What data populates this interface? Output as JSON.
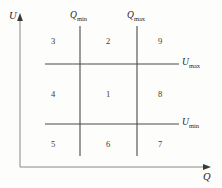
{
  "figure": {
    "background_color": "#fdfdfc",
    "line_color": "#4a4a4a",
    "axis_color": "#8a8a8a",
    "text_color": "#2a2a2a",
    "axes": {
      "y_axis_label": "U",
      "x_axis_label": "Q"
    },
    "vertical_dividers": [
      {
        "name": "Q-min",
        "label_base": "Q",
        "label_sub": "min",
        "x": 80
      },
      {
        "name": "Q-max",
        "label_base": "Q",
        "label_sub": "max",
        "x": 137
      }
    ],
    "horizontal_dividers": [
      {
        "name": "U-max",
        "label_base": "U",
        "label_sub": "max",
        "y": 64
      },
      {
        "name": "U-min",
        "label_base": "U",
        "label_sub": "min",
        "y": 124
      }
    ],
    "zones": [
      {
        "id": "zone-3",
        "label": "3",
        "x": 53,
        "y": 41
      },
      {
        "id": "zone-2",
        "label": "2",
        "x": 108,
        "y": 41
      },
      {
        "id": "zone-9",
        "label": "9",
        "x": 160,
        "y": 41
      },
      {
        "id": "zone-4",
        "label": "4",
        "x": 53,
        "y": 94
      },
      {
        "id": "zone-1",
        "label": "1",
        "x": 108,
        "y": 94
      },
      {
        "id": "zone-8",
        "label": "8",
        "x": 160,
        "y": 94
      },
      {
        "id": "zone-5",
        "label": "5",
        "x": 53,
        "y": 144
      },
      {
        "id": "zone-6",
        "label": "6",
        "x": 108,
        "y": 144
      },
      {
        "id": "zone-7",
        "label": "7",
        "x": 160,
        "y": 144
      }
    ]
  }
}
